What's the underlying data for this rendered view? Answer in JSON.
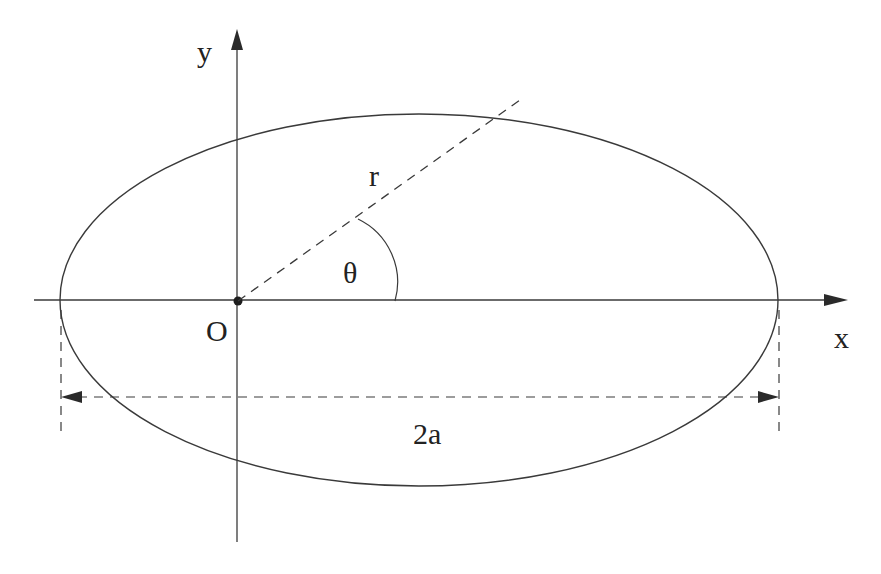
{
  "diagram": {
    "labels": {
      "y_axis": "y",
      "x_axis": "x",
      "origin": "O",
      "radius": "r",
      "angle": "θ",
      "major_axis": "2a"
    },
    "colors": {
      "stroke": "#3a3a3a",
      "text": "#222222",
      "background": "#ffffff"
    }
  }
}
